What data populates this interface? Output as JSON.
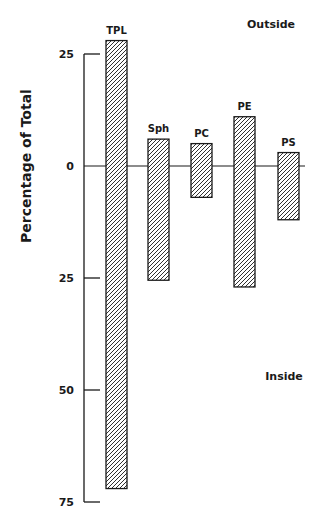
{
  "chart_data": {
    "type": "bar",
    "subtype": "diverging-range",
    "title": "",
    "ylabel": "Percentage of Total",
    "xlabel": "",
    "region_labels": {
      "top": "Outside",
      "bottom": "Inside"
    },
    "y_ticks": [
      {
        "label": "25",
        "value": 25
      },
      {
        "label": "0",
        "value": 0
      },
      {
        "label": "25",
        "value": -25
      },
      {
        "label": "50",
        "value": -50
      },
      {
        "label": "75",
        "value": -75
      }
    ],
    "ylim": [
      -75,
      28
    ],
    "categories": [
      "TPL",
      "Sph",
      "PC",
      "PE",
      "PS"
    ],
    "series": [
      {
        "name": "Outside",
        "values": [
          28,
          6,
          5,
          11,
          3
        ]
      },
      {
        "name": "Inside",
        "values": [
          72,
          25.5,
          7,
          27,
          12
        ]
      }
    ],
    "grid": false,
    "legend": "none",
    "fill_pattern": "diagonal-hatch",
    "colors": {
      "ink": "#1a1a1a",
      "background": "#ffffff"
    }
  }
}
